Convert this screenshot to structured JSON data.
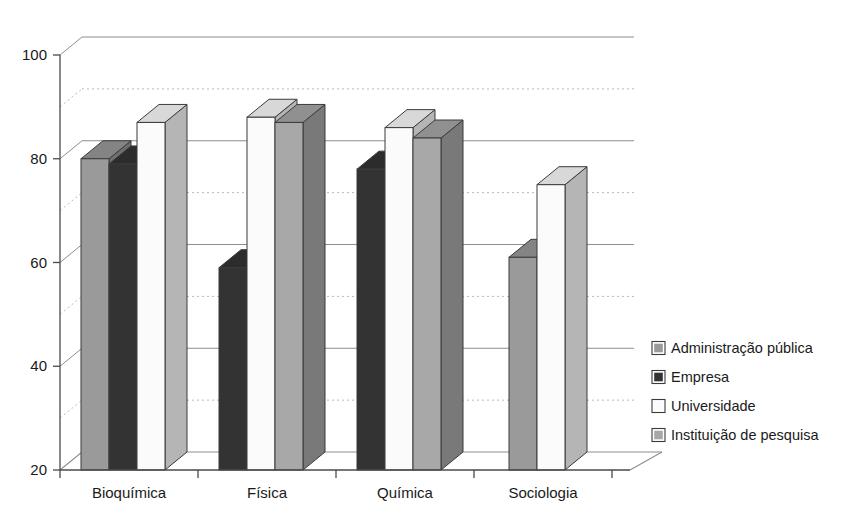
{
  "chart_data": {
    "type": "bar",
    "title": "",
    "subtitle": "",
    "xlabel": "",
    "ylabel": "",
    "ylim": [
      20,
      100
    ],
    "ytick_values": [
      20,
      40,
      60,
      80,
      100
    ],
    "ytick_labels": [
      "20",
      "40",
      "60",
      "80",
      "100"
    ],
    "minor_gridlines": [
      30,
      50,
      70,
      90
    ],
    "grid": "major solid, minor dotted",
    "style": "3d-perspective-column",
    "legend_position": "right",
    "categories": [
      "Bioquímica",
      "Física",
      "Química",
      "Sociologia"
    ],
    "series": [
      {
        "name": "Administração pública",
        "color": "#9a9a9a",
        "values": [
          80,
          null,
          null,
          61
        ]
      },
      {
        "name": "Empresa",
        "color": "#333333",
        "values": [
          79,
          59,
          78,
          null
        ]
      },
      {
        "name": "Universidade",
        "color": "#fbfbfb",
        "values": [
          87,
          88,
          86,
          75
        ]
      },
      {
        "name": "Instituição de pesquisa",
        "color": "#a8a8a8",
        "values": [
          null,
          87,
          84,
          null
        ]
      }
    ]
  },
  "legend": {
    "items": [
      {
        "label": "Administração pública",
        "color": "#9a9a9a"
      },
      {
        "label": "Empresa",
        "color": "#333333"
      },
      {
        "label": "Universidade",
        "color": "#fbfbfb"
      },
      {
        "label": "Instituição de pesquisa",
        "color": "#a8a8a8"
      }
    ]
  },
  "colors": {
    "administracao_publica": "#9a9a9a",
    "empresa": "#333333",
    "universidade": "#fbfbfb",
    "instituicao_pesquisa": "#a8a8a8",
    "axis": "#4a4a4a",
    "grid_major": "#8d8d8d",
    "grid_minor": "#b9b9b9",
    "background": "#ffffff"
  }
}
